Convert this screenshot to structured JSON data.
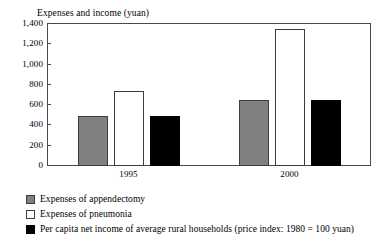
{
  "chart_data": {
    "type": "bar",
    "title": "Expenses and income (yuan)",
    "xlabel": "",
    "ylabel": "",
    "categories": [
      "1995",
      "2000"
    ],
    "series": [
      {
        "name": "Expenses of appendectomy",
        "color": "#808080",
        "values": [
          490,
          650
        ]
      },
      {
        "name": "Expenses of pneumonia",
        "color": "#ffffff",
        "values": [
          740,
          1350
        ]
      },
      {
        "name": "Per capita net income of average rural households (price index: 1980 = 100 yuan)",
        "color": "#000000",
        "values": [
          490,
          655
        ]
      }
    ],
    "ylim": [
      0,
      1400
    ],
    "yticks": [
      0,
      200,
      400,
      600,
      800,
      1000,
      1200,
      1400
    ],
    "ytick_labels": [
      "0",
      "200",
      "400",
      "600",
      "800",
      "1,000",
      "1,200",
      "1,400"
    ],
    "grid": false,
    "legend_position": "bottom-left",
    "frame": true
  },
  "legend": {
    "items": [
      {
        "label": "Expenses of appendectomy",
        "swatch": "gray"
      },
      {
        "label": "Expenses of pneumonia",
        "swatch": "white"
      },
      {
        "label": "Per capita net income of average rural households (price index: 1980 = 100 yuan)",
        "swatch": "black"
      }
    ]
  }
}
